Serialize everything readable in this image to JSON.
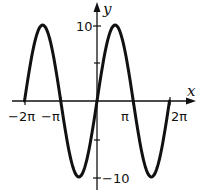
{
  "chart_data": {
    "type": "line",
    "title": "",
    "function": "y = 10 sin(x)",
    "xlabel": "x",
    "ylabel": "y",
    "xlim": [
      -6.2832,
      6.2832
    ],
    "ylim": [
      -10,
      10
    ],
    "x_ticks": [
      {
        "value": -6.2832,
        "label": "−2π"
      },
      {
        "value": -3.1416,
        "label": "−π"
      },
      {
        "value": 3.1416,
        "label": "π"
      },
      {
        "value": 6.2832,
        "label": "2π"
      }
    ],
    "y_ticks": [
      {
        "value": 10,
        "label": "10"
      },
      {
        "value": 5,
        "label": ""
      },
      {
        "value": -5,
        "label": ""
      },
      {
        "value": -10,
        "label": "−10"
      }
    ],
    "series": [
      {
        "name": "y = 10 sin x",
        "x": [
          -6.2832,
          -4.7124,
          -3.1416,
          -1.5708,
          0,
          1.5708,
          3.1416,
          4.7124,
          6.2832
        ],
        "y": [
          0,
          10,
          0,
          -10,
          0,
          10,
          0,
          -10,
          0
        ]
      }
    ],
    "grid": false
  },
  "labels": {
    "x_axis": "x",
    "y_axis": "y",
    "xtick_neg2pi": "−2π",
    "xtick_negpi": "−π",
    "xtick_pi": "π",
    "xtick_2pi": "2π",
    "ytick_10": "10",
    "ytick_neg10": "−10"
  }
}
